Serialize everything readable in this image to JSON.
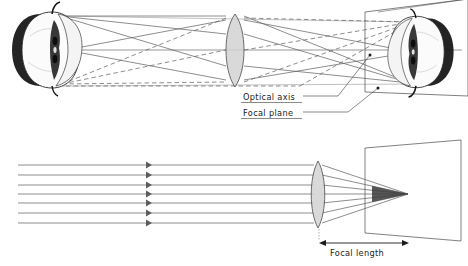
{
  "figure": {
    "background_color": "#ffffff"
  },
  "labels": {
    "optical_axis": "Optical axis",
    "focal_plane": "Focal plane",
    "focal_length": "Focal length"
  },
  "colors": {
    "ray": "#5c5c5c",
    "lens_fill": "#d2d2d2",
    "lens_stroke": "#4a4a4a",
    "plane_stroke": "#4a4a4a",
    "text": "#1a1a1a",
    "dimension": "#1a1a1a"
  },
  "top_diagram": {
    "name": "image-formation-diagram",
    "object": {
      "name": "apple-object",
      "description": "halved apple shown as object at left",
      "center_x": 52,
      "center_y": 50,
      "width": 86,
      "height": 72,
      "orientation": "upright"
    },
    "image": {
      "name": "apple-inverted-image",
      "description": "inverted apple image projected on focal plane at right",
      "center_x": 416,
      "center_y": 52,
      "width": 80,
      "height": 66,
      "orientation": "inverted"
    },
    "lens": {
      "name": "convex-lens",
      "center_x": 235,
      "top_y": 14,
      "bottom_y": 87,
      "half_thickness": 9
    },
    "focal_plane": {
      "name": "focal-plane-quad",
      "corners": [
        [
          365,
          12
        ],
        [
          468,
          0
        ],
        [
          468,
          95
        ],
        [
          365,
          92
        ]
      ]
    },
    "optical_axis": {
      "y": 50,
      "x_start": 40,
      "x_end": 460
    },
    "ray_bundles": [
      {
        "from": "object-top",
        "style": "solid"
      },
      {
        "from": "object-center",
        "style": "solid"
      },
      {
        "from": "object-bottom",
        "style": "dashed"
      }
    ]
  },
  "bottom_diagram": {
    "name": "focal-length-diagram",
    "parallel_rays": {
      "count": 7,
      "x_start": 18,
      "x_lens": 316,
      "arrow_x": 148,
      "y_values": [
        165,
        175,
        185,
        194,
        203,
        213,
        223
      ]
    },
    "lens": {
      "name": "convex-lens",
      "center_x": 318,
      "top_y": 161,
      "bottom_y": 228,
      "half_thickness": 7
    },
    "focal_point": {
      "x": 408,
      "y": 194
    },
    "focal_plane": {
      "name": "focal-plane-quad",
      "corners": [
        [
          365,
          148
        ],
        [
          460,
          140
        ],
        [
          460,
          240
        ],
        [
          365,
          233
        ]
      ]
    },
    "focal_length_dimension": {
      "x_start": 320,
      "x_end": 408,
      "y": 243
    }
  }
}
